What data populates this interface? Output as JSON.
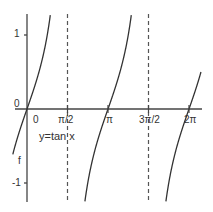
{
  "chart_data": {
    "type": "line",
    "title": "",
    "annotation": "y=tan x",
    "side_label": "f",
    "xlabel": "",
    "ylabel": "",
    "x_ticks": [
      "0",
      "π/2",
      "π",
      "3π/2",
      "2π"
    ],
    "x_tick_values": [
      0,
      1.5708,
      3.1416,
      4.7124,
      6.2832
    ],
    "y_ticks": [
      "1",
      "0",
      "-1"
    ],
    "y_tick_values": [
      1,
      0,
      -1
    ],
    "asymptotes": [
      1.5708,
      4.7124
    ],
    "xlim": [
      -0.55,
      6.75
    ],
    "ylim": [
      -1.27,
      1.28
    ],
    "grid": false,
    "series": [
      {
        "name": "y=tan x",
        "function": "tan(x)",
        "color": "#333333"
      }
    ]
  },
  "labels": {
    "y_one": "1",
    "y_zero": "0",
    "y_neg_one": "-1",
    "x_zero": "0",
    "x_half_pi": "π/2",
    "x_pi": "π",
    "x_three_half_pi": "3π/2",
    "x_two_pi": "2π",
    "curve_label": "y=tan x",
    "f_label": "f"
  }
}
